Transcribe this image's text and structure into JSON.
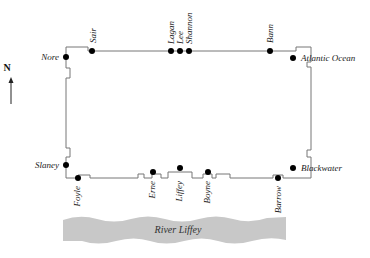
{
  "compass": {
    "label": "N",
    "icon": "north-arrow-icon"
  },
  "river": {
    "label": "River Liffey",
    "color": "#c8c8c8"
  },
  "outline_color": "#777777",
  "gates": {
    "sair": "Sair",
    "lagan": "Lagan",
    "lee": "Lee",
    "shannon": "Shannon",
    "bann": "Bann",
    "nore": "Nore",
    "atlantic": "Atlantic Ocean",
    "slaney": "Slaney",
    "blackwater": "Blackwater",
    "foyle": "Foyle",
    "erne": "Erne",
    "liffey": "Liffey",
    "boyne": "Boyne",
    "barrow": "Barrow"
  }
}
